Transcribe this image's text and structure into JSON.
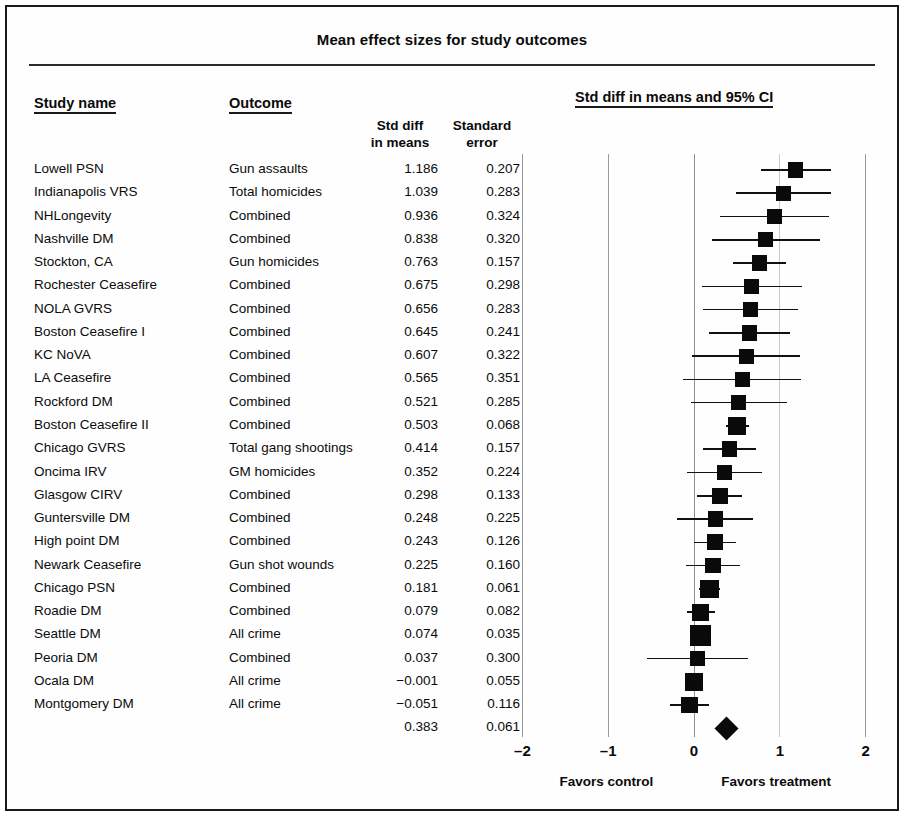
{
  "figure": {
    "title": "Mean effect sizes for study outcomes"
  },
  "headers": {
    "study_name": "Study name",
    "outcome": "Outcome",
    "std_diff_line1": "Std diff",
    "std_diff_line2": "in means",
    "std_error_line1": "Standard",
    "std_error_line2": "error",
    "plot": "Std diff in means and 95% CI"
  },
  "axis": {
    "ticks": [
      "–2",
      "–1",
      "0",
      "1",
      "2"
    ],
    "tick_values": [
      -2,
      -1,
      0,
      1,
      2
    ],
    "favors_control": "Favors control",
    "favors_treatment": "Favors treatment"
  },
  "chart_data": {
    "type": "scatter",
    "subtype": "forest-plot",
    "title": "Mean effect sizes for study outcomes",
    "xlabel": "Std diff in means and 95% CI",
    "ylabel": "",
    "xlim": [
      -2,
      2
    ],
    "xticks": [
      -2,
      -1,
      0,
      1,
      2
    ],
    "grid": true,
    "legend": "",
    "columns": [
      "Study name",
      "Outcome",
      "Std diff in means",
      "Standard error"
    ],
    "effect_measure": "Std diff in means",
    "ci_level": "95%",
    "rows": [
      {
        "study": "Lowell PSN",
        "outcome": "Gun assaults",
        "std_diff": 1.186,
        "std_error": 0.207,
        "ci_low": 0.78,
        "ci_high": 1.592
      },
      {
        "study": "Indianapolis VRS",
        "outcome": "Total homicides",
        "std_diff": 1.039,
        "std_error": 0.283,
        "ci_low": 0.484,
        "ci_high": 1.594
      },
      {
        "study": "NHLongevity",
        "outcome": "Combined",
        "std_diff": 0.936,
        "std_error": 0.324,
        "ci_low": 0.301,
        "ci_high": 1.571
      },
      {
        "study": "Nashville DM",
        "outcome": "Combined",
        "std_diff": 0.838,
        "std_error": 0.32,
        "ci_low": 0.211,
        "ci_high": 1.465
      },
      {
        "study": "Stockton, CA",
        "outcome": "Gun homicides",
        "std_diff": 0.763,
        "std_error": 0.157,
        "ci_low": 0.455,
        "ci_high": 1.071
      },
      {
        "study": "Rochester Ceasefire",
        "outcome": "Combined",
        "std_diff": 0.675,
        "std_error": 0.298,
        "ci_low": 0.091,
        "ci_high": 1.259
      },
      {
        "study": "NOLA GVRS",
        "outcome": "Combined",
        "std_diff": 0.656,
        "std_error": 0.283,
        "ci_low": 0.101,
        "ci_high": 1.211
      },
      {
        "study": "Boston Ceasefire I",
        "outcome": "Combined",
        "std_diff": 0.645,
        "std_error": 0.241,
        "ci_low": 0.173,
        "ci_high": 1.117
      },
      {
        "study": "KC NoVA",
        "outcome": "Combined",
        "std_diff": 0.607,
        "std_error": 0.322,
        "ci_low": -0.024,
        "ci_high": 1.238
      },
      {
        "study": "LA Ceasefire",
        "outcome": "Combined",
        "std_diff": 0.565,
        "std_error": 0.351,
        "ci_low": -0.123,
        "ci_high": 1.253
      },
      {
        "study": "Rockford DM",
        "outcome": "Combined",
        "std_diff": 0.521,
        "std_error": 0.285,
        "ci_low": -0.038,
        "ci_high": 1.08
      },
      {
        "study": "Boston Ceasefire II",
        "outcome": "Combined",
        "std_diff": 0.503,
        "std_error": 0.068,
        "ci_low": 0.37,
        "ci_high": 0.636
      },
      {
        "study": "Chicago GVRS",
        "outcome": "Total gang shootings",
        "std_diff": 0.414,
        "std_error": 0.157,
        "ci_low": 0.106,
        "ci_high": 0.722
      },
      {
        "study": "Oncima IRV",
        "outcome": "GM homicides",
        "std_diff": 0.352,
        "std_error": 0.224,
        "ci_low": -0.087,
        "ci_high": 0.791
      },
      {
        "study": "Glasgow CIRV",
        "outcome": "Combined",
        "std_diff": 0.298,
        "std_error": 0.133,
        "ci_low": 0.037,
        "ci_high": 0.559
      },
      {
        "study": "Guntersville DM",
        "outcome": "Combined",
        "std_diff": 0.248,
        "std_error": 0.225,
        "ci_low": -0.193,
        "ci_high": 0.689
      },
      {
        "study": "High point DM",
        "outcome": "Combined",
        "std_diff": 0.243,
        "std_error": 0.126,
        "ci_low": -0.004,
        "ci_high": 0.49
      },
      {
        "study": "Newark Ceasefire",
        "outcome": "Gun shot wounds",
        "std_diff": 0.225,
        "std_error": 0.16,
        "ci_low": -0.089,
        "ci_high": 0.539
      },
      {
        "study": "Chicago PSN",
        "outcome": "Combined",
        "std_diff": 0.181,
        "std_error": 0.061,
        "ci_low": 0.061,
        "ci_high": 0.301
      },
      {
        "study": "Roadie DM",
        "outcome": "Combined",
        "std_diff": 0.079,
        "std_error": 0.082,
        "ci_low": -0.082,
        "ci_high": 0.24
      },
      {
        "study": "Seattle DM",
        "outcome": "All crime",
        "std_diff": 0.074,
        "std_error": 0.035,
        "ci_low": 0.006,
        "ci_high": 0.142
      },
      {
        "study": "Peoria DM",
        "outcome": "Combined",
        "std_diff": 0.037,
        "std_error": 0.3,
        "ci_low": -0.551,
        "ci_high": 0.625
      },
      {
        "study": "Ocala DM",
        "outcome": "All crime",
        "std_diff": -0.001,
        "std_error": 0.055,
        "ci_low": -0.109,
        "ci_high": 0.107
      },
      {
        "study": "Montgomery DM",
        "outcome": "All crime",
        "std_diff": -0.051,
        "std_error": 0.116,
        "ci_low": -0.278,
        "ci_high": 0.176
      }
    ],
    "summary": {
      "study": "",
      "outcome": "",
      "std_diff": 0.383,
      "std_error": 0.061,
      "ci_low": 0.264,
      "ci_high": 0.502,
      "marker": "diamond"
    }
  },
  "display": {
    "rows": [
      {
        "study": "Lowell PSN",
        "outcome": "Gun assaults",
        "std_diff": "1.186",
        "std_error": "0.207"
      },
      {
        "study": "Indianapolis VRS",
        "outcome": "Total homicides",
        "std_diff": "1.039",
        "std_error": "0.283"
      },
      {
        "study": "NHLongevity",
        "outcome": "Combined",
        "std_diff": "0.936",
        "std_error": "0.324"
      },
      {
        "study": "Nashville DM",
        "outcome": "Combined",
        "std_diff": "0.838",
        "std_error": "0.320"
      },
      {
        "study": "Stockton, CA",
        "outcome": "Gun homicides",
        "std_diff": "0.763",
        "std_error": "0.157"
      },
      {
        "study": "Rochester Ceasefire",
        "outcome": "Combined",
        "std_diff": "0.675",
        "std_error": "0.298"
      },
      {
        "study": "NOLA GVRS",
        "outcome": "Combined",
        "std_diff": "0.656",
        "std_error": "0.283"
      },
      {
        "study": "Boston Ceasefire I",
        "outcome": "Combined",
        "std_diff": "0.645",
        "std_error": "0.241"
      },
      {
        "study": "KC NoVA",
        "outcome": "Combined",
        "std_diff": "0.607",
        "std_error": "0.322"
      },
      {
        "study": "LA Ceasefire",
        "outcome": "Combined",
        "std_diff": "0.565",
        "std_error": "0.351"
      },
      {
        "study": "Rockford DM",
        "outcome": "Combined",
        "std_diff": "0.521",
        "std_error": "0.285"
      },
      {
        "study": "Boston Ceasefire II",
        "outcome": "Combined",
        "std_diff": "0.503",
        "std_error": "0.068"
      },
      {
        "study": "Chicago GVRS",
        "outcome": "Total gang shootings",
        "std_diff": "0.414",
        "std_error": "0.157"
      },
      {
        "study": "Oncima IRV",
        "outcome": "GM homicides",
        "std_diff": "0.352",
        "std_error": "0.224"
      },
      {
        "study": "Glasgow CIRV",
        "outcome": "Combined",
        "std_diff": "0.298",
        "std_error": "0.133"
      },
      {
        "study": "Guntersville DM",
        "outcome": "Combined",
        "std_diff": "0.248",
        "std_error": "0.225"
      },
      {
        "study": "High point DM",
        "outcome": "Combined",
        "std_diff": "0.243",
        "std_error": "0.126"
      },
      {
        "study": "Newark Ceasefire",
        "outcome": "Gun shot wounds",
        "std_diff": "0.225",
        "std_error": "0.160"
      },
      {
        "study": "Chicago PSN",
        "outcome": "Combined",
        "std_diff": "0.181",
        "std_error": "0.061"
      },
      {
        "study": "Roadie DM",
        "outcome": "Combined",
        "std_diff": "0.079",
        "std_error": "0.082"
      },
      {
        "study": "Seattle DM",
        "outcome": "All crime",
        "std_diff": "0.074",
        "std_error": "0.035"
      },
      {
        "study": "Peoria DM",
        "outcome": "Combined",
        "std_diff": "0.037",
        "std_error": "0.300"
      },
      {
        "study": "Ocala DM",
        "outcome": "All crime",
        "std_diff": "−0.001",
        "std_error": "0.055"
      },
      {
        "study": "Montgomery DM",
        "outcome": "All crime",
        "std_diff": "−0.051",
        "std_error": "0.116"
      },
      {
        "study": "",
        "outcome": "",
        "std_diff": "0.383",
        "std_error": "0.061"
      }
    ]
  },
  "colors": {
    "marker": "#0a0a0a",
    "rule": "#1a1a1a",
    "grid": "#9a9a9a",
    "text": "#0b0b0b",
    "background": "#ffffff"
  }
}
